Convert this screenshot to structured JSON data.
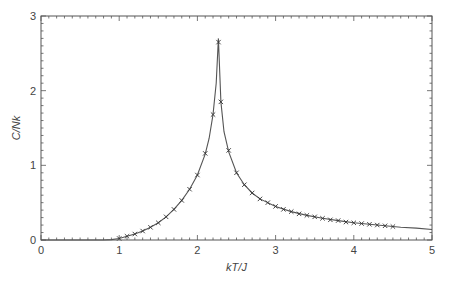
{
  "chart_data": {
    "type": "line",
    "title": "",
    "xlabel": "kT/J",
    "ylabel": "C/Nk",
    "xlim": [
      0,
      5
    ],
    "ylim": [
      0,
      3
    ],
    "x_ticks": [
      0,
      1,
      2,
      3,
      4,
      5
    ],
    "y_ticks": [
      0,
      1,
      2,
      3
    ],
    "x_minor_step": 0.1,
    "y_minor_step": 0.1,
    "grid": false,
    "legend": null,
    "series": [
      {
        "name": "exact solution",
        "style": "line",
        "color": "#555555",
        "x": [
          0.0,
          0.8,
          0.9,
          1.0,
          1.1,
          1.2,
          1.3,
          1.4,
          1.5,
          1.6,
          1.7,
          1.8,
          1.9,
          2.0,
          2.1,
          2.15,
          2.2,
          2.24,
          2.269,
          2.3,
          2.34,
          2.4,
          2.5,
          2.6,
          2.7,
          2.8,
          3.0,
          3.2,
          3.4,
          3.6,
          3.8,
          4.0,
          4.2,
          4.4,
          4.6,
          4.8,
          5.0
        ],
        "y": [
          0.0,
          0.0,
          0.005,
          0.02,
          0.05,
          0.08,
          0.12,
          0.17,
          0.23,
          0.31,
          0.41,
          0.53,
          0.68,
          0.87,
          1.15,
          1.36,
          1.68,
          2.1,
          2.7,
          1.85,
          1.45,
          1.18,
          0.9,
          0.74,
          0.63,
          0.55,
          0.45,
          0.38,
          0.33,
          0.29,
          0.26,
          0.23,
          0.21,
          0.19,
          0.17,
          0.16,
          0.14
        ]
      },
      {
        "name": "simulation",
        "style": "x-markers",
        "color": "#333333",
        "x": [
          1.0,
          1.1,
          1.2,
          1.3,
          1.4,
          1.5,
          1.6,
          1.7,
          1.8,
          1.9,
          2.0,
          2.1,
          2.2,
          2.27,
          2.3,
          2.4,
          2.5,
          2.6,
          2.7,
          2.8,
          2.9,
          3.0,
          3.1,
          3.2,
          3.3,
          3.4,
          3.5,
          3.6,
          3.7,
          3.8,
          3.9,
          4.0,
          4.1,
          4.2,
          4.3,
          4.4,
          4.5
        ],
        "y": [
          0.02,
          0.05,
          0.08,
          0.12,
          0.17,
          0.23,
          0.31,
          0.41,
          0.53,
          0.68,
          0.87,
          1.16,
          1.68,
          2.65,
          1.85,
          1.2,
          0.9,
          0.74,
          0.63,
          0.55,
          0.5,
          0.45,
          0.41,
          0.38,
          0.35,
          0.33,
          0.31,
          0.29,
          0.27,
          0.26,
          0.24,
          0.23,
          0.22,
          0.21,
          0.2,
          0.19,
          0.18
        ]
      }
    ]
  },
  "labels": {
    "x_axis": "kT/J",
    "y_axis": "C/Nk"
  }
}
